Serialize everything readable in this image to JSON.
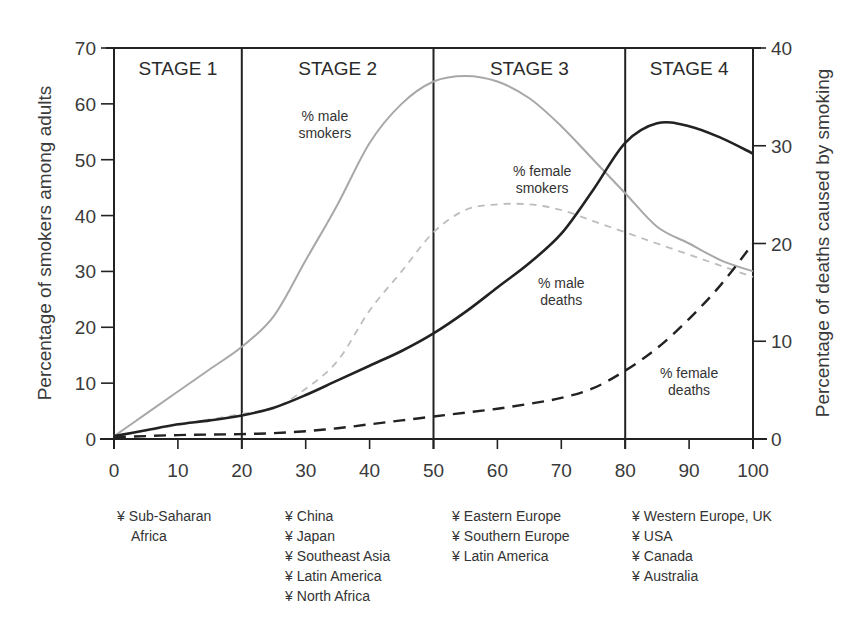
{
  "chart_data": {
    "type": "line",
    "title": "",
    "xlabel": "",
    "ylabel": "Percentage of smokers among adults",
    "ylabel_right": "Percentage of deaths caused by smoking",
    "xlim": [
      0,
      100
    ],
    "ylim": [
      0,
      70
    ],
    "ylim_right": [
      0,
      40
    ],
    "x_ticks": [
      0,
      10,
      20,
      30,
      40,
      50,
      60,
      70,
      80,
      90,
      100
    ],
    "y_ticks": [
      0,
      10,
      20,
      30,
      40,
      50,
      60,
      70
    ],
    "y_ticks_right": [
      0,
      10,
      20,
      30,
      40
    ],
    "grid": false,
    "legend": "inline annotations",
    "stages": [
      {
        "label": "STAGE 1",
        "start": 0,
        "end": 20
      },
      {
        "label": "STAGE 2",
        "start": 20,
        "end": 50
      },
      {
        "label": "STAGE 3",
        "start": 50,
        "end": 80
      },
      {
        "label": "STAGE 4",
        "start": 80,
        "end": 100
      }
    ],
    "series": [
      {
        "name": "% male smokers",
        "axis": "left",
        "style": "solid-gray",
        "x": [
          0,
          5,
          10,
          15,
          20,
          25,
          30,
          35,
          40,
          45,
          50,
          55,
          60,
          65,
          70,
          75,
          80,
          85,
          90,
          95,
          100
        ],
        "values": [
          0.5,
          4.5,
          8.5,
          12.5,
          16.5,
          22,
          32,
          42,
          53,
          60,
          64,
          65,
          64,
          61,
          56,
          50,
          44,
          38,
          35,
          32,
          30
        ]
      },
      {
        "name": "% female smokers",
        "axis": "left",
        "style": "dashed-gray",
        "x": [
          0,
          5,
          10,
          15,
          20,
          25,
          30,
          35,
          40,
          45,
          50,
          55,
          60,
          65,
          70,
          75,
          80,
          85,
          90,
          95,
          100
        ],
        "values": [
          0.5,
          1.5,
          2.5,
          3.5,
          4.5,
          5.5,
          9,
          14,
          23,
          30,
          37,
          41,
          42,
          42,
          41,
          39,
          37,
          35,
          33,
          31,
          29
        ]
      },
      {
        "name": "% male deaths",
        "axis": "right",
        "style": "solid-black",
        "x": [
          0,
          5,
          10,
          15,
          20,
          25,
          30,
          35,
          40,
          45,
          50,
          55,
          60,
          65,
          70,
          75,
          80,
          85,
          90,
          95,
          100
        ],
        "values": [
          0.3,
          0.9,
          1.5,
          1.9,
          2.4,
          3.2,
          4.5,
          6.0,
          7.5,
          9.0,
          10.8,
          13.0,
          15.5,
          18.0,
          21.0,
          25.5,
          30.3,
          32.3,
          32.0,
          30.8,
          29.2
        ]
      },
      {
        "name": "% female deaths",
        "axis": "right",
        "style": "dashed-black",
        "x": [
          0,
          5,
          10,
          15,
          20,
          25,
          30,
          35,
          40,
          45,
          50,
          55,
          60,
          65,
          70,
          75,
          80,
          85,
          90,
          95,
          100
        ],
        "values": [
          0.2,
          0.3,
          0.4,
          0.45,
          0.5,
          0.6,
          0.8,
          1.1,
          1.5,
          1.9,
          2.3,
          2.7,
          3.1,
          3.6,
          4.2,
          5.2,
          7.0,
          9.3,
          12.3,
          15.8,
          20.0
        ]
      }
    ],
    "annotations": [
      {
        "text": [
          "% male",
          "smokers"
        ],
        "x": 33,
        "y_left": 57
      },
      {
        "text": [
          "% female",
          "smokers"
        ],
        "x": 67,
        "y_left": 47
      },
      {
        "text": [
          "% male",
          "deaths"
        ],
        "x": 70,
        "y_left": 27
      },
      {
        "text": [
          "% female",
          "deaths"
        ],
        "x": 90,
        "y_left": 11
      }
    ],
    "colors": {
      "axis": "#222222",
      "male_smokers": "#a8a8a8",
      "female_smokers": "#bdbdbd",
      "male_deaths": "#222222",
      "female_deaths": "#222222"
    }
  },
  "regions": [
    {
      "stage": "STAGE 1",
      "items": [
        [
          "Sub-Saharan",
          "Africa"
        ]
      ]
    },
    {
      "stage": "STAGE 2",
      "items": [
        [
          "China"
        ],
        [
          "Japan"
        ],
        [
          "Southeast Asia"
        ],
        [
          "Latin America"
        ],
        [
          "North Africa"
        ]
      ]
    },
    {
      "stage": "STAGE 3",
      "items": [
        [
          "Eastern Europe"
        ],
        [
          "Southern Europe"
        ],
        [
          "Latin America"
        ]
      ]
    },
    {
      "stage": "STAGE 4",
      "items": [
        [
          "Western Europe, UK"
        ],
        [
          "USA"
        ],
        [
          "Canada"
        ],
        [
          "Australia"
        ]
      ]
    }
  ],
  "bullet_glyph": "¥"
}
